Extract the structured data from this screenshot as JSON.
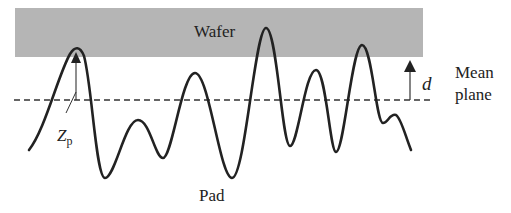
{
  "diagram": {
    "labels": {
      "wafer": "Wafer",
      "pad": "Pad",
      "mean_plane_line1": "Mean",
      "mean_plane_line2": "plane",
      "d": "d",
      "zp_main": "Z",
      "zp_sub": "p"
    },
    "colors": {
      "wafer_fill": "#b5b5b5",
      "curve": "#222222",
      "dashed_line": "#333333",
      "arrow": "#222222"
    }
  }
}
